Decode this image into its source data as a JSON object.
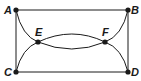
{
  "diagram": {
    "type": "graph",
    "points": {
      "A": {
        "label": "A",
        "x": 16,
        "y": 10
      },
      "B": {
        "label": "B",
        "x": 128,
        "y": 10
      },
      "C": {
        "label": "C",
        "x": 16,
        "y": 72
      },
      "D": {
        "label": "D",
        "x": 128,
        "y": 72
      },
      "E": {
        "label": "E",
        "x": 38,
        "y": 42
      },
      "F": {
        "label": "F",
        "x": 105,
        "y": 42
      }
    },
    "edges": [
      {
        "from": "A",
        "to": "B",
        "kind": "straight"
      },
      {
        "from": "C",
        "to": "D",
        "kind": "straight"
      },
      {
        "from": "A",
        "to": "C",
        "kind": "straight"
      },
      {
        "from": "B",
        "to": "D",
        "kind": "straight"
      },
      {
        "from": "A",
        "to": "F",
        "kind": "arc",
        "via": "E"
      },
      {
        "from": "E",
        "to": "B",
        "kind": "arc",
        "via": "F"
      },
      {
        "from": "C",
        "to": "F",
        "kind": "arc",
        "via": "E"
      },
      {
        "from": "E",
        "to": "D",
        "kind": "arc",
        "via": "F"
      }
    ],
    "colors": {
      "stroke": "#1a1a1a",
      "background": "#ffffff"
    }
  }
}
